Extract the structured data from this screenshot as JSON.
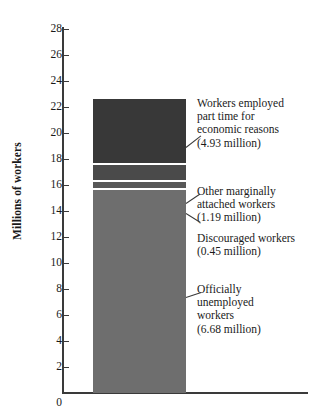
{
  "chart_data": {
    "type": "bar",
    "title": "",
    "xlabel": "",
    "ylabel": "Millions of workers",
    "ylim": [
      0,
      28
    ],
    "ytick_step": 2,
    "yticks": [
      28,
      26,
      24,
      22,
      20,
      18,
      16,
      14,
      12,
      10,
      8,
      6,
      4,
      2,
      0
    ],
    "grid": false,
    "legend": "none",
    "stacked": true,
    "categories": [
      "Underutilized labor"
    ],
    "total": 22.62,
    "series": [
      {
        "name": "Workers employed part time for economic reasons",
        "values": [
          4.93
        ],
        "color": "#383838"
      },
      {
        "name": "Other marginally attached workers",
        "values": [
          1.19
        ],
        "color": "#4a4a4a"
      },
      {
        "name": "Discouraged workers",
        "values": [
          0.45
        ],
        "color": "#585858"
      },
      {
        "name": "Officially unemployed workers",
        "values": [
          6.68
        ],
        "color": "#6e6e6e"
      }
    ],
    "annotations": [
      {
        "lines": [
          "Workers employed",
          "part time for",
          "economic reasons",
          "(4.93 million)"
        ]
      },
      {
        "lines": [
          "Other marginally",
          "attached workers",
          "(1.19 million)"
        ]
      },
      {
        "lines": [
          "Discouraged workers",
          "(0.45 million)"
        ]
      },
      {
        "lines": [
          "Officially",
          "unemployed",
          "workers",
          "(6.68 million)"
        ]
      }
    ]
  },
  "axis": {
    "zero": "0",
    "title": "Millions of workers",
    "ticks": [
      "28",
      "26",
      "24",
      "22",
      "20",
      "18",
      "16",
      "14",
      "12",
      "10",
      "8",
      "6",
      "4",
      "2"
    ]
  },
  "annotation_text": {
    "a1_l1": "Workers employed",
    "a1_l2": "part time for",
    "a1_l3": "economic reasons",
    "a1_l4": "(4.93 million)",
    "a2_l1": "Other marginally",
    "a2_l2": "attached workers",
    "a2_l3": "(1.19 million)",
    "a3_l1": "Discouraged workers",
    "a3_l2": "(0.45 million)",
    "a4_l1": "Officially",
    "a4_l2": "unemployed",
    "a4_l3": "workers",
    "a4_l4": "(6.68 million)"
  }
}
